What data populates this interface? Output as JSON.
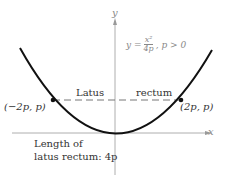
{
  "axes": {
    "x_label": "x",
    "y_label": "y"
  },
  "equation": {
    "lhs": "y =",
    "numerator": "x²",
    "denominator": "4p",
    "condition": ", p > 0"
  },
  "latus_rectum": {
    "left_label": "Latus",
    "right_label": "rectum"
  },
  "points": {
    "left": "(−2p, p)",
    "right": "(2p, p)"
  },
  "note": {
    "line1": "Length of",
    "line2": "latus rectum: 4p"
  },
  "colors": {
    "curve": "#111111",
    "axis": "#999999",
    "dashed": "#777777"
  }
}
